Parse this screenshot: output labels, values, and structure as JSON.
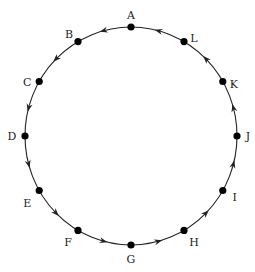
{
  "diagram": {
    "type": "directed-cycle",
    "direction": "counterclockwise",
    "center": [
      131,
      136
    ],
    "radius": [
      106,
      109
    ],
    "nodes": [
      {
        "label": "A",
        "angle": 90,
        "lx": 0,
        "ly": -12
      },
      {
        "label": "B",
        "angle": 120,
        "lx": -9,
        "ly": -8
      },
      {
        "label": "C",
        "angle": 150,
        "lx": -12,
        "ly": 0
      },
      {
        "label": "D",
        "angle": 180,
        "lx": -13,
        "ly": 0
      },
      {
        "label": "E",
        "angle": 210,
        "lx": -12,
        "ly": 12
      },
      {
        "label": "F",
        "angle": 240,
        "lx": -10,
        "ly": 12
      },
      {
        "label": "G",
        "angle": 270,
        "lx": 0,
        "ly": 14
      },
      {
        "label": "H",
        "angle": 300,
        "lx": 10,
        "ly": 12
      },
      {
        "label": "I",
        "angle": 330,
        "lx": 12,
        "ly": 6
      },
      {
        "label": "J",
        "angle": 0,
        "lx": 11,
        "ly": 0
      },
      {
        "label": "K",
        "angle": 30,
        "lx": 11,
        "ly": 2
      },
      {
        "label": "L",
        "angle": 60,
        "lx": 10,
        "ly": -4
      }
    ],
    "edges": [
      "A→B",
      "B→C",
      "C→D",
      "D→E",
      "E→F",
      "F→G",
      "G→H",
      "H→I",
      "I→J",
      "J→K",
      "K→L",
      "L→A"
    ],
    "colors": {
      "stroke": "#222222",
      "node": "#000000",
      "label": "#222222"
    }
  }
}
